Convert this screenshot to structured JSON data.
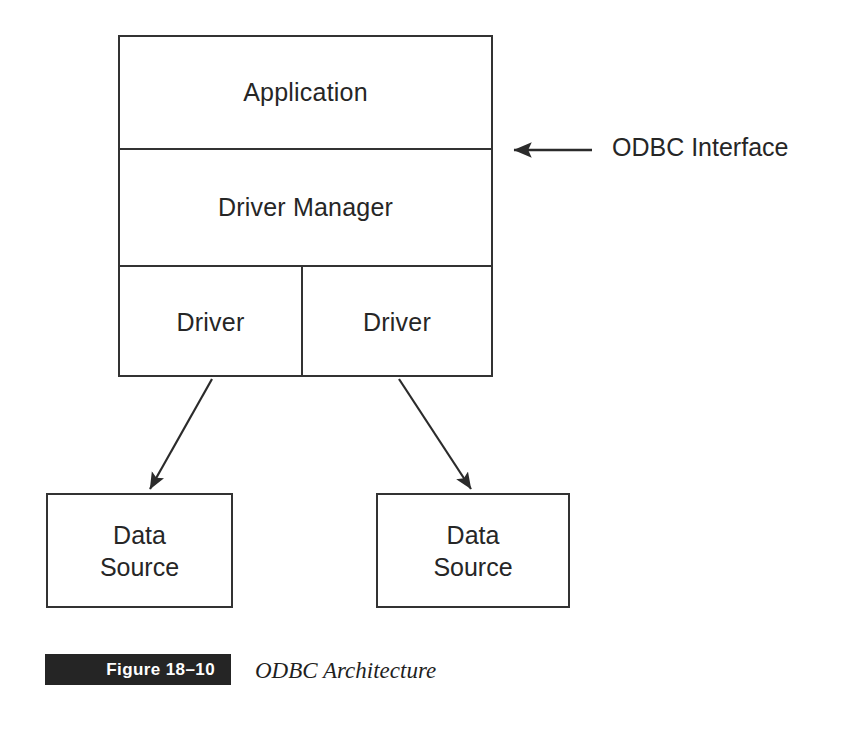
{
  "figure": {
    "title": "ODBC Architecture",
    "badge_label": "Figure 18–10",
    "badge_color": "#252525",
    "stroke_color": "#333333",
    "background": "#ffffff"
  },
  "diagram": {
    "type": "layered-architecture",
    "stack": {
      "rows": [
        {
          "id": "application",
          "label": "Application",
          "cells": [
            {
              "label": "Application"
            }
          ]
        },
        {
          "id": "driver-manager",
          "label": "Driver Manager",
          "cells": [
            {
              "label": "Driver Manager"
            }
          ]
        },
        {
          "id": "drivers",
          "label": "Drivers",
          "cells": [
            {
              "label": "Driver"
            },
            {
              "label": "Driver"
            }
          ]
        }
      ]
    },
    "data_sources": [
      {
        "id": "data-source-left",
        "line1": "Data",
        "line2": "Source"
      },
      {
        "id": "data-source-right",
        "line1": "Data",
        "line2": "Source"
      }
    ],
    "annotations": [
      {
        "id": "odbc-interface",
        "label": "ODBC Interface",
        "points_to": "boundary between Application and Driver Manager"
      }
    ],
    "connectors": [
      {
        "from": "driver-left",
        "to": "data-source-left",
        "style": "arrow"
      },
      {
        "from": "driver-right",
        "to": "data-source-right",
        "style": "arrow"
      }
    ]
  }
}
